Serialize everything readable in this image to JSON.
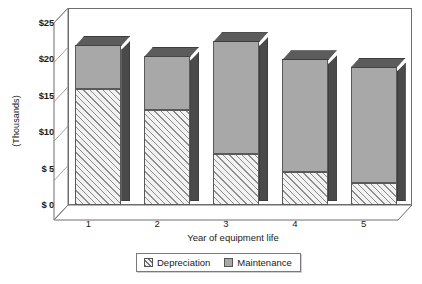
{
  "chart_data": {
    "type": "bar",
    "subtype": "stacked-3d-column",
    "title": "",
    "xlabel": "Year of equipment life",
    "ylabel": "(Thousands)",
    "categories": [
      "1",
      "2",
      "3",
      "4",
      "5"
    ],
    "series": [
      {
        "name": "Depreciation",
        "values": [
          16,
          13,
          7,
          4.5,
          3
        ],
        "fill": "diagonal-hatch",
        "color": "#f2f2f2"
      },
      {
        "name": "Maintenance",
        "values": [
          6,
          7.5,
          15.5,
          15.5,
          16
        ],
        "fill": "solid",
        "color": "#a8a8a8"
      }
    ],
    "totals": [
      22,
      20.5,
      22.5,
      20,
      19
    ],
    "ylim": [
      0,
      25
    ],
    "yticks": [
      0,
      5,
      10,
      15,
      20,
      25
    ],
    "ytick_labels": [
      "$ 0",
      "$ 5",
      "$10",
      "$15",
      "$20",
      "$25"
    ],
    "grid": false,
    "legend_position": "bottom"
  },
  "axis": {
    "y_title": "(Thousands)",
    "x_title": "Year of equipment life"
  },
  "legend": {
    "items": [
      {
        "label": "Depreciation",
        "swatch": "hatch-swatch-icon"
      },
      {
        "label": "Maintenance",
        "swatch": "solid-swatch-icon"
      }
    ]
  }
}
